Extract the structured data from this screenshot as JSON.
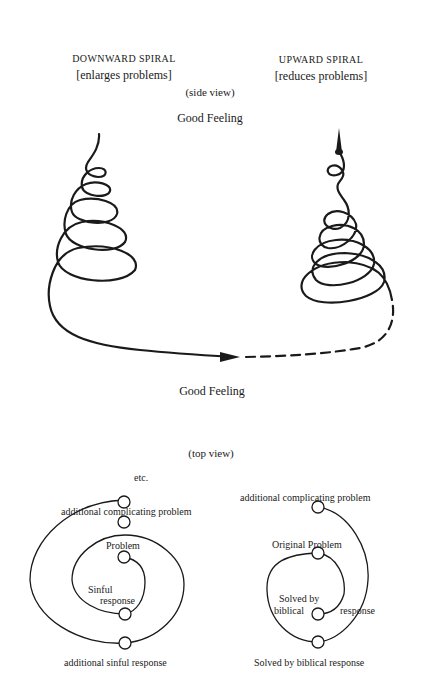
{
  "side_view": {
    "left_title": "DOWNWARD SPIRAL",
    "left_subtitle": "[enlarges problems]",
    "right_title": "UPWARD SPIRAL",
    "right_subtitle": "[reduces problems]",
    "caption": "(side view)",
    "top_label": "Good Feeling",
    "bottom_label": "Good Feeling"
  },
  "top_view": {
    "caption": "(top view)",
    "left": {
      "etc": "etc.",
      "additional_problem": "additional complicating problem",
      "problem": "Problem",
      "sinful_1": "Sinful",
      "sinful_2": "response",
      "additional_sinful": "additional sinful response"
    },
    "right": {
      "additional_problem": "additional complicating problem",
      "original_problem": "Original Problem",
      "solved_1": "Solved by",
      "solved_2": "biblical",
      "solved_3": "response",
      "solved_bottom": "Solved by biblical response"
    }
  }
}
